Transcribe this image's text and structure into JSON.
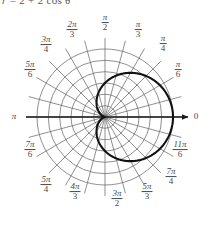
{
  "caption": {
    "equation_text": "r = 2 + 2 cos θ",
    "lhs": "r",
    "eq": "=",
    "rhs": "2 + 2 cos θ"
  },
  "plot": {
    "title": "polar-grid-limacon",
    "origin_label": "0",
    "center": {
      "x": 105,
      "y": 117
    },
    "max_radius": 68,
    "circle_count": 6,
    "radial_line_count": 24,
    "axis_arrow_label": "0",
    "grid_color": "#6b6b6b",
    "curve_color": "#1a1a1a",
    "axis_color": "#1a1a1a",
    "background_color": "#ffffff"
  },
  "angle_labels": [
    {
      "id": "angle-0",
      "display": "0",
      "kind": "plain",
      "num": "0",
      "den": "",
      "x": 196,
      "y": 117
    },
    {
      "id": "angle-pi-6",
      "display": "π/6",
      "kind": "frac",
      "num": "π",
      "den": "6",
      "x": 178,
      "y": 70
    },
    {
      "id": "angle-pi-4",
      "display": "π/4",
      "kind": "frac",
      "num": "π",
      "den": "4",
      "x": 163,
      "y": 44
    },
    {
      "id": "angle-pi-3",
      "display": "π/3",
      "kind": "frac",
      "num": "π",
      "den": "3",
      "x": 138,
      "y": 30
    },
    {
      "id": "angle-pi-2",
      "display": "π/2",
      "kind": "frac",
      "num": "π",
      "den": "2",
      "x": 105,
      "y": 23
    },
    {
      "id": "angle-2pi-3",
      "display": "2π/3",
      "kind": "frac",
      "num": "2π",
      "den": "3",
      "x": 72,
      "y": 30
    },
    {
      "id": "angle-3pi-4",
      "display": "3π/4",
      "kind": "frac",
      "num": "3π",
      "den": "4",
      "x": 46,
      "y": 45
    },
    {
      "id": "angle-5pi-6",
      "display": "5π/6",
      "kind": "frac",
      "num": "5π",
      "den": "6",
      "x": 30,
      "y": 70
    },
    {
      "id": "angle-pi",
      "display": "π",
      "kind": "plain",
      "num": "π",
      "den": "",
      "x": 14,
      "y": 117
    },
    {
      "id": "angle-7pi-6",
      "display": "7π/6",
      "kind": "frac",
      "num": "7π",
      "den": "6",
      "x": 30,
      "y": 150
    },
    {
      "id": "angle-5pi-4",
      "display": "5π/4",
      "kind": "frac",
      "num": "5π",
      "den": "4",
      "x": 46,
      "y": 185
    },
    {
      "id": "angle-4pi-3",
      "display": "4π/3",
      "kind": "frac",
      "num": "4π",
      "den": "3",
      "x": 75,
      "y": 192
    },
    {
      "id": "angle-3pi-2",
      "display": "3π/2",
      "kind": "frac",
      "num": "3π",
      "den": "2",
      "x": 117,
      "y": 199
    },
    {
      "id": "angle-5pi-3",
      "display": "5π/3",
      "kind": "frac",
      "num": "5π",
      "den": "3",
      "x": 147,
      "y": 192
    },
    {
      "id": "angle-7pi-4",
      "display": "7π/4",
      "kind": "frac",
      "num": "7π",
      "den": "4",
      "x": 171,
      "y": 177
    },
    {
      "id": "angle-11pi-6",
      "display": "11π/6",
      "kind": "frac",
      "num": "11π",
      "den": "6",
      "x": 180,
      "y": 150
    }
  ],
  "chart_data": {
    "type": "line",
    "coordinate_system": "polar",
    "title": "r = 2 + 2 cos θ",
    "equation": "r = 2 + 2cos(θ)",
    "curve_name": "limacon-cardioid",
    "theta_unit": "radians",
    "theta_range": [
      0,
      6.283185307179586
    ],
    "r_range": [
      0,
      4
    ],
    "r_gridlines": [
      0.667,
      1.333,
      2.0,
      2.667,
      3.333,
      4.0
    ],
    "theta_gridlines_labeled": [
      "0",
      "π/6",
      "π/4",
      "π/3",
      "π/2",
      "2π/3",
      "3π/4",
      "5π/6",
      "π",
      "7π/6",
      "5π/4",
      "4π/3",
      "3π/2",
      "5π/3",
      "7π/4",
      "11π/6"
    ],
    "grid": true,
    "legend": false,
    "xlabel": "",
    "ylabel": "",
    "series": [
      {
        "name": "r = 2 + 2 cos θ",
        "theta": [
          0,
          0.2618,
          0.5236,
          0.7854,
          1.0472,
          1.309,
          1.5708,
          1.8326,
          2.0944,
          2.3562,
          2.618,
          2.8798,
          3.1416,
          3.4034,
          3.6652,
          3.927,
          4.1888,
          4.4506,
          4.7124,
          4.9742,
          5.236,
          5.4978,
          5.7596,
          6.0214,
          6.2832
        ],
        "r": [
          4.0,
          3.932,
          3.732,
          3.414,
          3.0,
          2.518,
          2.0,
          1.482,
          1.0,
          0.586,
          0.268,
          0.068,
          0.0,
          0.068,
          0.268,
          0.586,
          1.0,
          1.482,
          2.0,
          2.518,
          3.0,
          3.414,
          3.732,
          3.932,
          4.0
        ]
      }
    ]
  }
}
